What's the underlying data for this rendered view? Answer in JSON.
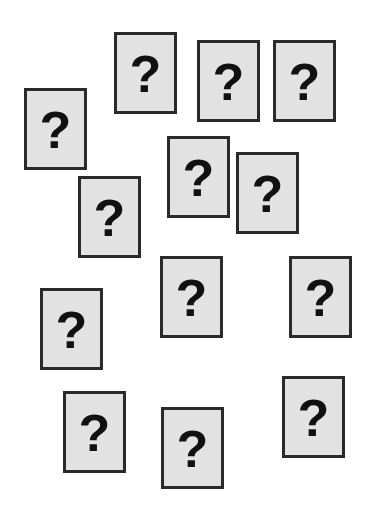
{
  "cards": [
    {
      "symbol": "?",
      "x": 114,
      "y": 32
    },
    {
      "symbol": "?",
      "x": 197,
      "y": 40
    },
    {
      "symbol": "?",
      "x": 273,
      "y": 40
    },
    {
      "symbol": "?",
      "x": 24,
      "y": 88
    },
    {
      "symbol": "?",
      "x": 167,
      "y": 136
    },
    {
      "symbol": "?",
      "x": 236,
      "y": 152
    },
    {
      "symbol": "?",
      "x": 78,
      "y": 176
    },
    {
      "symbol": "?",
      "x": 160,
      "y": 256
    },
    {
      "symbol": "?",
      "x": 289,
      "y": 256
    },
    {
      "symbol": "?",
      "x": 40,
      "y": 288
    },
    {
      "symbol": "?",
      "x": 282,
      "y": 376
    },
    {
      "symbol": "?",
      "x": 63,
      "y": 391
    },
    {
      "symbol": "?",
      "x": 161,
      "y": 407
    }
  ],
  "colors": {
    "card_fill": "#e2e2e2",
    "card_border": "#2a2a2a",
    "glyph": "#111111"
  }
}
